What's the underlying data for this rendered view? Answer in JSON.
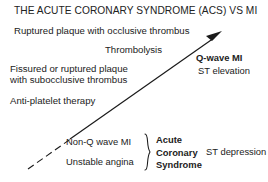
{
  "diagram": {
    "title": "THE ACUTE CORONARY SYNDROME (ACS) VS MI",
    "pathology_top": "Ruptured plaque with occlusive thrombus",
    "treatment_top": "Thrombolysis",
    "pathology_mid_line1": "Fissured or ruptured plaque",
    "pathology_mid_line2": "with subocclusive thrombus",
    "treatment_mid": "Anti-platelet therapy",
    "outcome_top_bold": "Q-wave MI",
    "outcome_top_detail": "ST elevation",
    "acs_item_1": "Non-Q wave MI",
    "acs_item_2": "Unstable angina",
    "acs_group_line1": "Acute",
    "acs_group_line2": "Coronary",
    "acs_group_line3": "Syndrome",
    "outcome_bottom_detail": "ST depression",
    "colors": {
      "background": "#ffffff",
      "text": "#222222",
      "line": "#1a1a1a"
    }
  }
}
